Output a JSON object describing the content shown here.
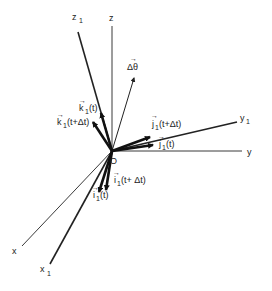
{
  "diagram": {
    "type": "3D rotating coordinate frame",
    "origin": {
      "label": "O"
    },
    "axes": [
      {
        "id": "z",
        "label": "z"
      },
      {
        "id": "z1",
        "label": "z",
        "subscript": "1"
      },
      {
        "id": "y",
        "label": "y"
      },
      {
        "id": "y1",
        "label": "y",
        "subscript": "1"
      },
      {
        "id": "x",
        "label": "x"
      },
      {
        "id": "x1",
        "label": "x",
        "subscript": "1"
      }
    ],
    "vectors": [
      {
        "id": "delta-theta",
        "label": "Δθ",
        "arrow": "→"
      },
      {
        "id": "k1-t",
        "label": "k",
        "subscript": "1",
        "arg": "(t)",
        "arrow": "→"
      },
      {
        "id": "k1-t-dt",
        "label": "k",
        "subscript": "1",
        "arg": "(t+Δt)",
        "arrow": "→"
      },
      {
        "id": "j1-t-dt",
        "label": "j",
        "subscript": "1",
        "arg": "(t+Δt)",
        "arrow": "→"
      },
      {
        "id": "j1-t",
        "label": "j",
        "subscript": "1",
        "arg": "(t)",
        "arrow": "→"
      },
      {
        "id": "i1-t",
        "label": "i",
        "subscript": "1",
        "arg": "(t)",
        "arrow": "→"
      },
      {
        "id": "i1-t-dt",
        "label": "i",
        "subscript": "1",
        "arg": "(t+ Δt)",
        "arrow": "→"
      }
    ]
  }
}
